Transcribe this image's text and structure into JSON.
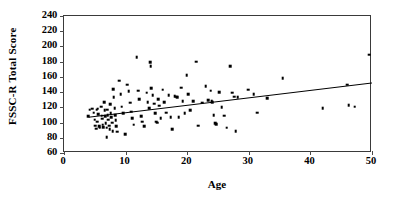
{
  "chart_data": {
    "type": "scatter",
    "title": "",
    "xlabel": "Age",
    "ylabel": "FSSC-R Total Score",
    "xlim": [
      0,
      50
    ],
    "ylim": [
      60,
      240
    ],
    "xticks": [
      0,
      10,
      20,
      30,
      40,
      50
    ],
    "yticks": [
      60,
      80,
      100,
      120,
      140,
      160,
      180,
      200,
      220,
      240
    ],
    "grid": false,
    "legend": "none",
    "marker": "square",
    "marker_color": "#000000",
    "frame_color": "#3a3a3a",
    "series": [
      {
        "name": "Participants",
        "points": [
          [
            3.9,
            108
          ],
          [
            4.2,
            117
          ],
          [
            4.6,
            118
          ],
          [
            4.8,
            113
          ],
          [
            5.0,
            104
          ],
          [
            5.1,
            96
          ],
          [
            5.2,
            92
          ],
          [
            5.3,
            117
          ],
          [
            5.4,
            101
          ],
          [
            5.5,
            118
          ],
          [
            5.6,
            111
          ],
          [
            5.7,
            95
          ],
          [
            5.8,
            93
          ],
          [
            6.0,
            121
          ],
          [
            6.1,
            109
          ],
          [
            6.2,
            105
          ],
          [
            6.3,
            97
          ],
          [
            6.4,
            94
          ],
          [
            6.5,
            127
          ],
          [
            6.6,
            116
          ],
          [
            6.7,
            108
          ],
          [
            6.8,
            99
          ],
          [
            6.9,
            93
          ],
          [
            7.0,
            117
          ],
          [
            7.1,
            110
          ],
          [
            7.2,
            104
          ],
          [
            7.3,
            96
          ],
          [
            7.4,
            91
          ],
          [
            7.5,
            124
          ],
          [
            7.6,
            112
          ],
          [
            7.7,
            107
          ],
          [
            7.8,
            100
          ],
          [
            7.9,
            89
          ],
          [
            6.9,
            81
          ],
          [
            8.0,
            144
          ],
          [
            8.1,
            133
          ],
          [
            8.2,
            119
          ],
          [
            8.3,
            110
          ],
          [
            8.4,
            103
          ],
          [
            8.5,
            95
          ],
          [
            8.6,
            88
          ],
          [
            9.0,
            155
          ],
          [
            9.2,
            137
          ],
          [
            9.4,
            121
          ],
          [
            9.6,
            112
          ],
          [
            9.9,
            85
          ],
          [
            10.3,
            150
          ],
          [
            10.5,
            141
          ],
          [
            10.7,
            126
          ],
          [
            10.9,
            114
          ],
          [
            11.1,
            106
          ],
          [
            11.3,
            97
          ],
          [
            11.8,
            186
          ],
          [
            12.0,
            142
          ],
          [
            12.2,
            131
          ],
          [
            12.5,
            108
          ],
          [
            12.7,
            101
          ],
          [
            13.0,
            95
          ],
          [
            13.4,
            139
          ],
          [
            13.6,
            127
          ],
          [
            13.8,
            119
          ],
          [
            14.0,
            179
          ],
          [
            14.1,
            174
          ],
          [
            14.2,
            145
          ],
          [
            14.4,
            136
          ],
          [
            14.6,
            125
          ],
          [
            14.8,
            112
          ],
          [
            15.0,
            101
          ],
          [
            15.1,
            100
          ],
          [
            15.3,
            131
          ],
          [
            15.5,
            122
          ],
          [
            15.7,
            106
          ],
          [
            16.0,
            143
          ],
          [
            16.3,
            127
          ],
          [
            16.6,
            113
          ],
          [
            17.0,
            136
          ],
          [
            17.3,
            107
          ],
          [
            17.6,
            91
          ],
          [
            18.0,
            135
          ],
          [
            18.2,
            134
          ],
          [
            18.4,
            133
          ],
          [
            18.6,
            107
          ],
          [
            19.0,
            146
          ],
          [
            19.3,
            128
          ],
          [
            19.6,
            112
          ],
          [
            19.9,
            162
          ],
          [
            20.2,
            137
          ],
          [
            20.5,
            116
          ],
          [
            21.0,
            128
          ],
          [
            21.5,
            180
          ],
          [
            21.8,
            96
          ],
          [
            22.4,
            126
          ],
          [
            23.0,
            148
          ],
          [
            23.4,
            129
          ],
          [
            23.8,
            142
          ],
          [
            24.0,
            128
          ],
          [
            24.1,
            127
          ],
          [
            24.3,
            110
          ],
          [
            24.5,
            99
          ],
          [
            24.7,
            98
          ],
          [
            25.2,
            140
          ],
          [
            25.6,
            120
          ],
          [
            26.0,
            109
          ],
          [
            26.4,
            93
          ],
          [
            27.0,
            174
          ],
          [
            27.3,
            139
          ],
          [
            27.6,
            134
          ],
          [
            27.9,
            89
          ],
          [
            28.2,
            133
          ],
          [
            29.9,
            143
          ],
          [
            30.8,
            137
          ],
          [
            31.4,
            113
          ],
          [
            33.0,
            132
          ],
          [
            35.5,
            158
          ],
          [
            42.0,
            119
          ],
          [
            46.0,
            150
          ],
          [
            46.2,
            123
          ],
          [
            47.2,
            121
          ],
          [
            49.5,
            189
          ]
        ]
      }
    ],
    "trendline": {
      "visible": true,
      "x_start": 4.0,
      "y_start": 107,
      "x_end": 50.0,
      "y_end": 152,
      "color": "#000000"
    }
  }
}
